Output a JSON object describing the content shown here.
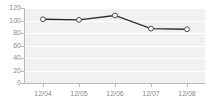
{
  "chart_data": {
    "type": "line",
    "title": "",
    "subtitle": "",
    "xlabel": "",
    "ylabel": "",
    "categories": [
      "12/04",
      "12/05",
      "12/06",
      "12/07",
      "12/08"
    ],
    "values": [
      102,
      101,
      108,
      87,
      86
    ],
    "series": [
      {
        "name": "series-1",
        "values": [
          102,
          101,
          108,
          87,
          86
        ],
        "line_color": "#2b2b2b",
        "marker": "open-circle",
        "marker_fill": "#ffffff",
        "marker_stroke": "#4a4a4a"
      }
    ],
    "ylim": [
      0,
      120
    ],
    "y_ticks": [
      0,
      20,
      40,
      60,
      80,
      100,
      120
    ],
    "y_tick_labels": [
      "0",
      "20",
      "40",
      "60",
      "80",
      "100",
      "120"
    ],
    "x_tick_labels": [
      "12/04",
      "12/05",
      "12/06",
      "12/07",
      "12/08"
    ],
    "grid": {
      "horizontal": true,
      "vertical": false,
      "color": "#ffffff"
    },
    "legend": {
      "visible": false,
      "position": "none",
      "entries": []
    },
    "annotations": [],
    "plot_background": "#f1f1f1",
    "figure_background": "#ffffff",
    "axis_color": "#b9b9b9",
    "tick_label_color": "#8a8a8a"
  }
}
